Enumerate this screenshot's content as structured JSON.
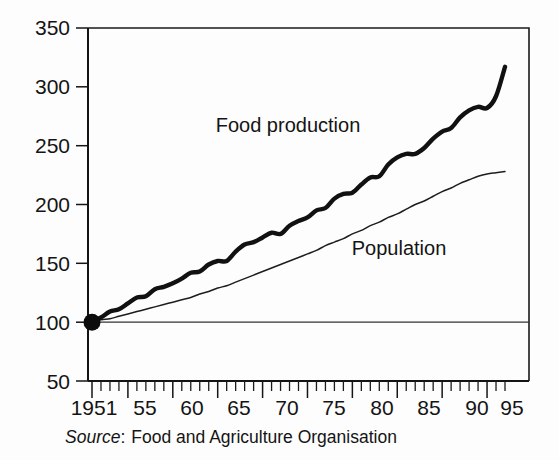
{
  "chart_data": {
    "type": "line",
    "title": "",
    "subtitle": "",
    "xlabel": "",
    "ylabel": "",
    "xlim": [
      1951,
      1997
    ],
    "ylim": [
      50,
      350
    ],
    "grid": false,
    "legend_position": "inline-annotations",
    "y_ticks": [
      50,
      100,
      150,
      200,
      250,
      300,
      350
    ],
    "y_tick_labels": [
      "50",
      "100",
      "150",
      "200",
      "250",
      "300",
      "350"
    ],
    "x_ticks": [
      1951,
      1955,
      1960,
      1965,
      1970,
      1975,
      1980,
      1985,
      1990,
      1995
    ],
    "x_tick_labels": [
      "1951",
      "55",
      "60",
      "65",
      "70",
      "75",
      "80",
      "85",
      "90",
      "95"
    ],
    "x_minor_tick_interval": 1,
    "reference_line": {
      "y": 100,
      "label": ""
    },
    "origin_marker": {
      "x": 1951,
      "y": 100
    },
    "x": [
      1951,
      1952,
      1953,
      1954,
      1955,
      1956,
      1957,
      1958,
      1959,
      1960,
      1961,
      1962,
      1963,
      1964,
      1965,
      1966,
      1967,
      1968,
      1969,
      1970,
      1971,
      1972,
      1973,
      1974,
      1975,
      1976,
      1977,
      1978,
      1979,
      1980,
      1981,
      1982,
      1983,
      1984,
      1985,
      1986,
      1987,
      1988,
      1989,
      1990,
      1991,
      1992,
      1993,
      1994,
      1995,
      1996,
      1997
    ],
    "series": [
      {
        "name": "Food production",
        "label": "Food production",
        "style": "thick-wavy",
        "values": [
          100,
          104,
          109,
          111,
          116,
          121,
          122,
          128,
          130,
          133,
          137,
          142,
          143,
          149,
          152,
          152,
          160,
          166,
          168,
          172,
          176,
          175,
          182,
          186,
          189,
          195,
          197,
          205,
          209,
          210,
          217,
          223,
          224,
          234,
          240,
          243,
          243,
          248,
          256,
          262,
          265,
          274,
          280,
          283,
          282,
          292,
          317
        ]
      },
      {
        "name": "Population",
        "label": "Population",
        "style": "thin-smooth",
        "values": [
          100,
          102,
          103,
          105,
          107,
          109,
          111,
          113,
          115,
          117,
          119,
          121,
          124,
          126,
          129,
          131,
          134,
          137,
          140,
          143,
          146,
          149,
          152,
          155,
          158,
          161,
          165,
          168,
          171,
          175,
          178,
          182,
          185,
          189,
          192,
          196,
          200,
          203,
          207,
          211,
          214,
          218,
          221,
          224,
          226,
          227,
          228
        ]
      }
    ],
    "annotations": [
      {
        "text": "Food production",
        "x": 1972.5,
        "y": 262
      },
      {
        "text": "Population",
        "x": 1985.5,
        "y": 160
      }
    ],
    "source": {
      "prefix": "Source",
      "separator": ":",
      "text": "Food and Agriculture Organisation",
      "full": "Source: Food and Agriculture Organisation"
    },
    "colors": {
      "background": "#fdfdfd",
      "axis": "#141414",
      "food_production_line": "#111111",
      "population_line": "#1d1d1d",
      "text": "#141414"
    }
  }
}
